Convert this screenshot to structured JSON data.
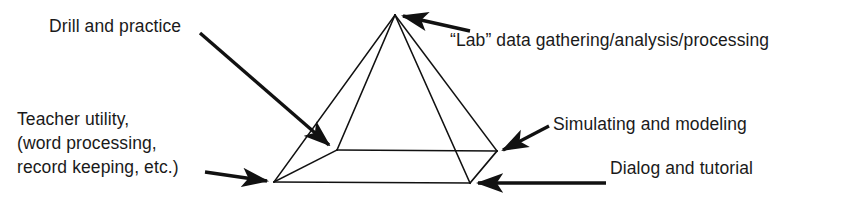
{
  "figure": {
    "background_color": "#ffffff",
    "ink_color": "#1a1a1a",
    "width": 846,
    "height": 202
  },
  "diagram": {
    "shape": "square-base-pyramid",
    "vertices": {
      "apex": {
        "x": 395,
        "y": 15
      },
      "base_back_left": {
        "x": 337,
        "y": 150
      },
      "base_back_right": {
        "x": 497,
        "y": 151
      },
      "base_front_left": {
        "x": 274,
        "y": 182
      },
      "base_front_right": {
        "x": 470,
        "y": 183
      }
    }
  },
  "labels": {
    "drill": "Drill and practice",
    "lab": "“Lab” data gathering/analysis/processing",
    "teacher_line1": "Teacher utility,",
    "teacher_line2": "(word processing,",
    "teacher_line3": "record keeping, etc.)",
    "simulating": "Simulating and modeling",
    "dialog": "Dialog and tutorial"
  },
  "callouts": [
    {
      "name": "drill-and-practice",
      "from": {
        "x": 200,
        "y": 33
      },
      "to": {
        "x": 333,
        "y": 148
      },
      "style": "thick-arrow"
    },
    {
      "name": "lab-data",
      "from": {
        "x": 470,
        "y": 31
      },
      "to": {
        "x": 399,
        "y": 14
      },
      "style": "thick-arrow"
    },
    {
      "name": "teacher-utility",
      "from": {
        "x": 205,
        "y": 172
      },
      "to": {
        "x": 271,
        "y": 182
      },
      "style": "thick-arrow"
    },
    {
      "name": "simulating-and-modeling",
      "from": {
        "x": 549,
        "y": 126
      },
      "to": {
        "x": 500,
        "y": 151
      },
      "style": "thick-arrow"
    },
    {
      "name": "dialog-and-tutorial",
      "from": {
        "x": 606,
        "y": 183
      },
      "to": {
        "x": 474,
        "y": 183
      },
      "style": "thick-arrow"
    }
  ]
}
